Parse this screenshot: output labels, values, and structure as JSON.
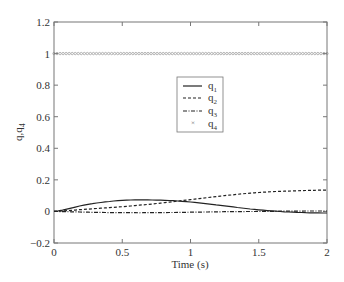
{
  "chart_data": {
    "type": "line",
    "title": "",
    "xlabel": "Time (s)",
    "ylabel": "q,q4",
    "xlim": [
      0,
      2
    ],
    "ylim": [
      -0.2,
      1.2
    ],
    "xticks": [
      "0",
      "0.5",
      "1",
      "1.5",
      "2"
    ],
    "yticks": [
      "-0.2",
      "0",
      "0.2",
      "0.4",
      "0.6",
      "0.8",
      "1",
      "1.2"
    ],
    "grid": false,
    "legend_position": "upper center-right",
    "x": [
      0,
      0.25,
      0.5,
      0.75,
      1.0,
      1.25,
      1.5,
      1.75,
      2.0
    ],
    "series": [
      {
        "name": "q1",
        "style": "solid",
        "values": [
          0,
          0.045,
          0.07,
          0.072,
          0.06,
          0.035,
          0.01,
          -0.005,
          -0.01
        ]
      },
      {
        "name": "q2",
        "style": "dashed",
        "values": [
          0,
          0.015,
          0.03,
          0.05,
          0.075,
          0.1,
          0.12,
          0.13,
          0.135
        ]
      },
      {
        "name": "q3",
        "style": "dashdot",
        "values": [
          0,
          -0.005,
          -0.008,
          -0.008,
          -0.005,
          -0.002,
          0.0,
          0.002,
          0.003
        ]
      },
      {
        "name": "q4",
        "style": "x-markers",
        "values": [
          1.0,
          1.0,
          1.0,
          1.0,
          1.0,
          1.0,
          1.0,
          1.0,
          1.0
        ]
      }
    ]
  },
  "legend": {
    "items": [
      {
        "label": "q",
        "sub": "1"
      },
      {
        "label": "q",
        "sub": "2"
      },
      {
        "label": "q",
        "sub": "3"
      },
      {
        "label": "q",
        "sub": "4"
      }
    ]
  },
  "axes": {
    "xlabel": "Time (s)",
    "ylabel_main": "q,q",
    "ylabel_sub": "4"
  }
}
